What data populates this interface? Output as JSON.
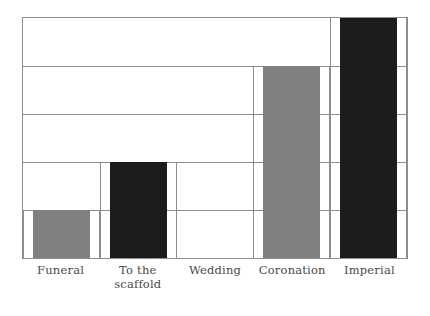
{
  "chart_data": {
    "type": "bar",
    "title": "",
    "subtitle": "",
    "xlabel": "",
    "ylabel": "",
    "categories": [
      "Funeral",
      "To the scaffold",
      "Wedding",
      "Coronation",
      "Imperial"
    ],
    "values": [
      1,
      2,
      0,
      4,
      5
    ],
    "ylim": [
      0,
      5
    ],
    "grid": true,
    "gridline_values": [
      1,
      2,
      3,
      4
    ],
    "legend": "none",
    "axis_tick_labels": [],
    "bar_colors": [
      "#808080",
      "#1c1c1c",
      "none",
      "#808080",
      "#1c1c1c"
    ],
    "series": [
      {
        "name": "",
        "points": [
          {
            "category": "Funeral",
            "value": 1,
            "color": "#808080"
          },
          {
            "category": "To the scaffold",
            "value": 2,
            "color": "#1c1c1c"
          },
          {
            "category": "Wedding",
            "value": 0,
            "color": "none"
          },
          {
            "category": "Coronation",
            "value": 4,
            "color": "#808080"
          },
          {
            "category": "Imperial",
            "value": 5,
            "color": "#1c1c1c"
          }
        ]
      }
    ]
  },
  "axis": {
    "frame_color": "#8d8d8d",
    "background": "#ffffff"
  },
  "labels": {
    "items": [
      {
        "line1": "Funeral",
        "line2": ""
      },
      {
        "line1": "To the",
        "line2": "scaffold"
      },
      {
        "line1": "Wedding",
        "line2": ""
      },
      {
        "line1": "Coronation",
        "line2": ""
      },
      {
        "line1": "Imperial",
        "line2": ""
      }
    ]
  }
}
